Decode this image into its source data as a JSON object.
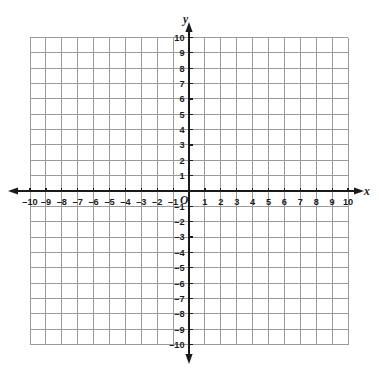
{
  "chart_data": {
    "type": "scatter",
    "title": "",
    "subtitle": "",
    "xlabel": "x",
    "ylabel": "y",
    "origin_label": "O",
    "xlim": [
      -10,
      10
    ],
    "ylim": [
      -10,
      10
    ],
    "grid": true,
    "grid_step": 1,
    "tick_step": 1,
    "legend": "none",
    "series": [],
    "annotations": [],
    "x_tick_labels": [
      "-10",
      "-9",
      "-8",
      "-7",
      "-6",
      "-5",
      "-4",
      "-3",
      "-2",
      "-1",
      "1",
      "2",
      "3",
      "4",
      "5",
      "6",
      "7",
      "8",
      "9",
      "10"
    ],
    "x_tick_values": [
      -10,
      -9,
      -8,
      -7,
      -6,
      -5,
      -4,
      -3,
      -2,
      -1,
      1,
      2,
      3,
      4,
      5,
      6,
      7,
      8,
      9,
      10
    ],
    "y_tick_labels": [
      "10",
      "9",
      "8",
      "7",
      "6",
      "5",
      "4",
      "3",
      "2",
      "1",
      "-1",
      "-2",
      "-3",
      "-4",
      "-5",
      "-6",
      "-7",
      "-8",
      "-9",
      "-10"
    ],
    "y_tick_values": [
      10,
      9,
      8,
      7,
      6,
      5,
      4,
      3,
      2,
      1,
      -1,
      -2,
      -3,
      -4,
      -5,
      -6,
      -7,
      -8,
      -9,
      -10
    ],
    "colors": {
      "grid_line": "#9a9a9a",
      "axis_line": "#1a1a1a",
      "label_text": "#1a1a1a",
      "background": "#ffffff"
    },
    "arrows": {
      "x_positive": true,
      "x_negative": true,
      "y_positive": true,
      "y_negative": true
    }
  },
  "figure": {
    "caption": ""
  }
}
